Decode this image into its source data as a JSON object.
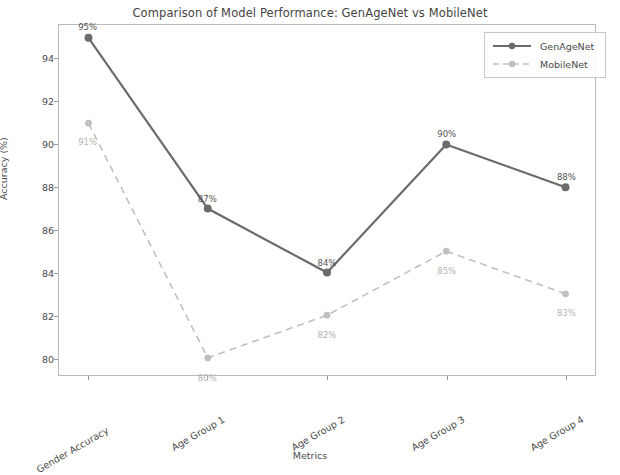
{
  "chart_data": {
    "type": "line",
    "title": "Comparison of Model Performance: GenAgeNet vs MobileNet",
    "xlabel": "Metrics",
    "ylabel": "Accuracy (%)",
    "categories": [
      "Gender Accuracy",
      "Age Group 1",
      "Age Group 2",
      "Age Group 3",
      "Age Group 4"
    ],
    "series": [
      {
        "name": "GenAgeNet",
        "values": [
          95,
          87,
          84,
          90,
          88
        ],
        "point_labels": [
          "95%",
          "87%",
          "84%",
          "90%",
          "88%"
        ],
        "color": "#6b6b6b",
        "linestyle": "solid",
        "marker": "circle"
      },
      {
        "name": "MobileNet",
        "values": [
          91,
          80,
          82,
          85,
          83
        ],
        "point_labels": [
          "91%",
          "80%",
          "82%",
          "85%",
          "83%"
        ],
        "color": "#c0c0c0",
        "linestyle": "dashed",
        "marker": "circle"
      }
    ],
    "ylim": [
      79.2,
      95.6
    ],
    "yticks": [
      80,
      82,
      84,
      86,
      88,
      90,
      92,
      94
    ],
    "ytick_labels": [
      "80",
      "82",
      "84",
      "86",
      "88",
      "90",
      "92",
      "94"
    ],
    "grid": false,
    "legend_position": "upper right"
  }
}
